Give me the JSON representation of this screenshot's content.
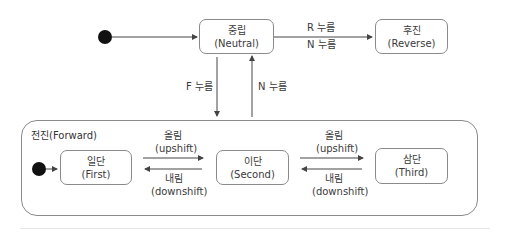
{
  "diagram": {
    "type": "state-machine",
    "top_initial": {
      "x": 105,
      "y": 37
    },
    "states": {
      "neutral": {
        "ko": "중립",
        "en": "(Neutral)"
      },
      "reverse": {
        "ko": "후진",
        "en": "(Reverse)"
      },
      "first": {
        "ko": "일단",
        "en": "(First)"
      },
      "second": {
        "ko": "이단",
        "en": "(Second)"
      },
      "third": {
        "ko": "삼단",
        "en": "(Third)"
      }
    },
    "composite": {
      "label": "전진(Forward)"
    },
    "transitions": {
      "neutral_to_reverse": "R 누름",
      "reverse_to_neutral": "N 누름",
      "neutral_to_forward": "F 누름",
      "forward_to_neutral": "N 누름",
      "first_to_second_ko": "올림",
      "first_to_second_en": "(upshift)",
      "second_to_first_ko": "내림",
      "second_to_first_en": "(downshift)",
      "second_to_third_ko": "올림",
      "second_to_third_en": "(upshift)",
      "third_to_second_ko": "내림",
      "third_to_second_en": "(downshift)"
    },
    "colors": {
      "line": "#8a8a8a",
      "arrow": "#444444",
      "initial": "#111111"
    }
  }
}
